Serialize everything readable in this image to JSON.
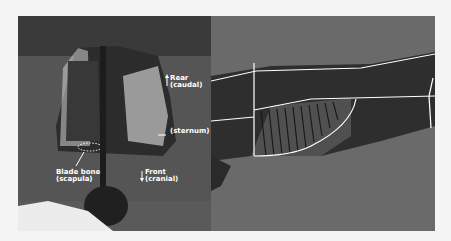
{
  "figure": {
    "left_photo": {
      "labels": {
        "rear": {
          "line1": "Rear",
          "line2": "(caudal)",
          "arrow": "up-arrow"
        },
        "sternum": {
          "line1": "(sternum)",
          "arrow": "left-arrow"
        },
        "blade_bone": {
          "line1": "Blade bone",
          "line2": "(scapula)"
        },
        "front": {
          "line1": "Front",
          "line2": "(cranial)",
          "arrow": "down-arrow"
        }
      }
    },
    "right_photo": {
      "description": "side view of carcass with white cut-line overlays"
    },
    "colors": {
      "background": "#f4f4f4",
      "label_text": "#ffffff",
      "cut_lines": "#ffffff"
    }
  }
}
